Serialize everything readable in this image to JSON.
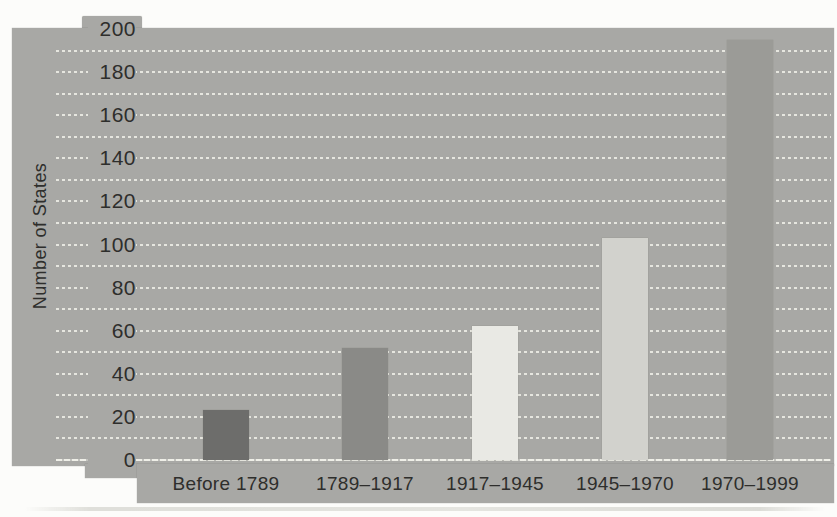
{
  "colors": {
    "page_background": "#fcfcfa",
    "panel_background": "#a8a8a5",
    "gridline": "#ebebe4",
    "text": "#2e2e2c",
    "bar_colors": [
      "#6d6d6b",
      "#8a8a87",
      "#e9e9e4",
      "#d2d2cd",
      "#9b9b97"
    ]
  },
  "chart_data": {
    "type": "bar",
    "title": "",
    "xlabel": "",
    "ylabel": "Number of States",
    "categories": [
      "Before 1789",
      "1789–1917",
      "1917–1945",
      "1945–1970",
      "1970–1999"
    ],
    "values": [
      23,
      52,
      62,
      103,
      195
    ],
    "ylim": [
      0,
      200
    ],
    "yticks": [
      0,
      20,
      40,
      60,
      80,
      100,
      120,
      140,
      160,
      180,
      200
    ],
    "gridline_interval": 10,
    "grid": "horizontal dashed white lines on gray panel",
    "legend": "none",
    "bar_colors": [
      "#6d6d6b",
      "#8a8a87",
      "#e9e9e4",
      "#d2d2cd",
      "#9b9b97"
    ]
  }
}
